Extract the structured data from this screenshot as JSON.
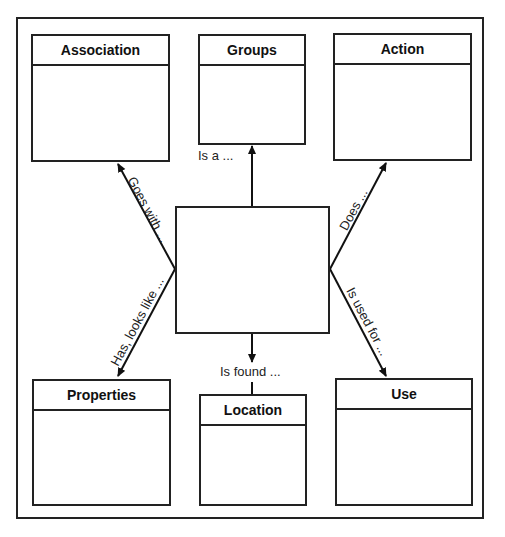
{
  "diagram": {
    "center": {
      "label": ""
    },
    "boxes": [
      {
        "id": "association",
        "title": "Association"
      },
      {
        "id": "groups",
        "title": "Groups"
      },
      {
        "id": "action",
        "title": "Action"
      },
      {
        "id": "properties",
        "title": "Properties"
      },
      {
        "id": "location",
        "title": "Location"
      },
      {
        "id": "use",
        "title": "Use"
      }
    ],
    "edges": [
      {
        "to": "association",
        "label": "Goes with ..."
      },
      {
        "to": "groups",
        "label": "Is a ..."
      },
      {
        "to": "action",
        "label": "Does ..."
      },
      {
        "to": "properties",
        "label": "Has, looks like ..."
      },
      {
        "to": "location",
        "label": "Is found ..."
      },
      {
        "to": "use",
        "label": "Is used for ..."
      }
    ]
  }
}
